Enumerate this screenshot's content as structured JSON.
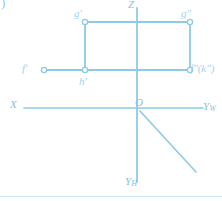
{
  "figure": {
    "index_label": ")",
    "stroke_color": "#8ecae6",
    "axis_color": "#8ecae6",
    "label_color": "#7fc4e8",
    "background": "#ffffff",
    "width": 222,
    "height": 201
  },
  "axes": {
    "z": {
      "name": "Z",
      "label": "Z"
    },
    "x": {
      "name": "X",
      "label": "X"
    },
    "y_w": {
      "name": "Y-W",
      "label": "Y",
      "subscript": "W"
    },
    "y_h": {
      "name": "Y-H",
      "label": "Y",
      "subscript": "H"
    },
    "origin": {
      "name": "origin",
      "label": "O"
    }
  },
  "points": [
    {
      "id": "g-prime",
      "label": "g'",
      "x": 85,
      "y": 22
    },
    {
      "id": "g-dprime",
      "label": "g\"",
      "x": 190,
      "y": 22
    },
    {
      "id": "f-prime",
      "label": "f'",
      "x": 44,
      "y": 70
    },
    {
      "id": "f-dprime-k",
      "label": "f\"(k\")",
      "x": 190,
      "y": 70
    },
    {
      "id": "h-prime",
      "label": "h'",
      "x": 85,
      "y": 70
    }
  ],
  "segments": [
    {
      "id": "top-horizontal",
      "x1": 85,
      "y1": 22,
      "x2": 190,
      "y2": 22
    },
    {
      "id": "left-vertical",
      "x1": 85,
      "y1": 22,
      "x2": 85,
      "y2": 70
    },
    {
      "id": "right-vertical",
      "x1": 190,
      "y1": 22,
      "x2": 190,
      "y2": 70
    },
    {
      "id": "lower-horizontal",
      "x1": 44,
      "y1": 70,
      "x2": 190,
      "y2": 70
    },
    {
      "id": "z-axis",
      "x1": 137,
      "y1": 8,
      "x2": 137,
      "y2": 182
    },
    {
      "id": "x-axis",
      "x1": 24,
      "y1": 108,
      "x2": 137,
      "y2": 108
    },
    {
      "id": "yw-axis",
      "x1": 137,
      "y1": 108,
      "x2": 203,
      "y2": 108
    },
    {
      "id": "yh-diagonal",
      "x1": 140,
      "y1": 111,
      "x2": 196,
      "y2": 172
    },
    {
      "id": "bottom-rule",
      "x1": 0,
      "y1": 196,
      "x2": 222,
      "y2": 196
    }
  ]
}
